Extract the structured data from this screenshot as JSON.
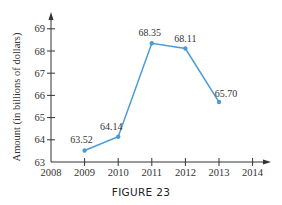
{
  "chart_data": {
    "type": "line",
    "title": "",
    "caption": "FIGURE 23",
    "xlabel": "",
    "ylabel": "Amount (in billions of dollars)",
    "x": [
      2009,
      2010,
      2011,
      2012,
      2013
    ],
    "values": [
      63.52,
      64.14,
      68.35,
      68.11,
      65.7
    ],
    "data_labels": [
      "63.52",
      "64.14",
      "68.35",
      "68.11",
      "65.70"
    ],
    "x_ticks": [
      "2008",
      "2009",
      "2010",
      "2011",
      "2012",
      "2013",
      "2014"
    ],
    "y_ticks": [
      "63",
      "64",
      "65",
      "66",
      "67",
      "68",
      "69"
    ],
    "xlim": [
      2008,
      2014.5
    ],
    "ylim": [
      63,
      69.7
    ],
    "grid": false,
    "legend": null,
    "line_color": "#4a9bd6",
    "axis_color": "#333333"
  }
}
